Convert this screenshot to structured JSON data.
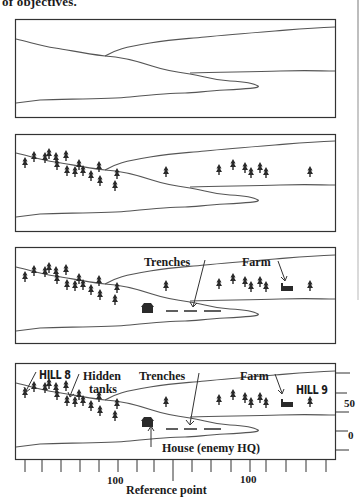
{
  "heading": "of objectives.",
  "panels": [
    {
      "id": 1,
      "description": "Terrain outline only"
    },
    {
      "id": 2,
      "description": "Terrain with trees"
    },
    {
      "id": 3,
      "description": "Terrain with trees and key features",
      "labels": {
        "trenches": "Trenches",
        "farm": "Farm"
      }
    },
    {
      "id": 4,
      "description": "Terrain with features, objectives and scale",
      "labels": {
        "hill_left": "HILL 8",
        "hidden_tanks_1": "Hidden",
        "hidden_tanks_2": "tanks",
        "trenches": "Trenches",
        "farm": "Farm",
        "hill_right": "HILL 9",
        "house": "House (enemy HQ)"
      },
      "vertical_scale": {
        "upper": "50",
        "lower": "0"
      },
      "horizontal_scale": {
        "left": "100",
        "right": "100",
        "center": "Reference point"
      }
    }
  ],
  "colors": {
    "ink": "#2a2a2a",
    "line": "#555555",
    "paper": "#ffffff"
  }
}
